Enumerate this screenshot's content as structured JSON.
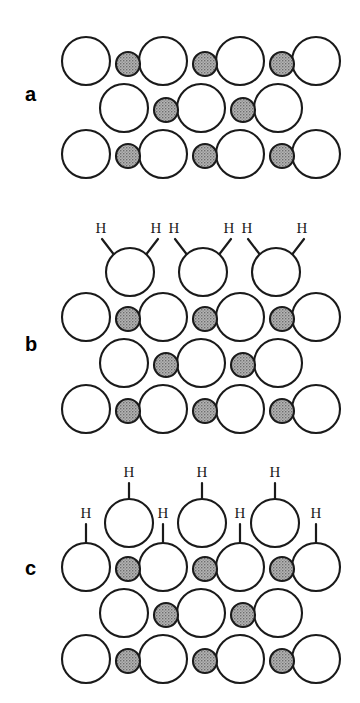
{
  "figure": {
    "background_color": "#ffffff",
    "stroke_color": "#1a1a1a",
    "large_atom_fill": "#ffffff",
    "small_atom_fill": "#9b9b9b",
    "small_atom_texture": "stipple",
    "bond_color": "#1a1a1a",
    "hydrogen_symbol": "H"
  },
  "panels": [
    {
      "id": "a",
      "label": "a",
      "label_x": 25,
      "label_y": 84,
      "description": "clean surface lattice without hydrogen",
      "hydrogen_count": 0,
      "large_atoms": [
        {
          "cx": 86,
          "cy": 61,
          "r": 24
        },
        {
          "cx": 163,
          "cy": 61,
          "r": 24
        },
        {
          "cx": 240,
          "cy": 61,
          "r": 24
        },
        {
          "cx": 316,
          "cy": 61,
          "r": 24
        },
        {
          "cx": 124,
          "cy": 108,
          "r": 24
        },
        {
          "cx": 201,
          "cy": 108,
          "r": 24
        },
        {
          "cx": 278,
          "cy": 108,
          "r": 24
        },
        {
          "cx": 86,
          "cy": 154,
          "r": 24
        },
        {
          "cx": 163,
          "cy": 154,
          "r": 24
        },
        {
          "cx": 240,
          "cy": 154,
          "r": 24
        },
        {
          "cx": 316,
          "cy": 154,
          "r": 24
        }
      ],
      "small_atoms": [
        {
          "cx": 128,
          "cy": 64,
          "r": 12
        },
        {
          "cx": 205,
          "cy": 64,
          "r": 12
        },
        {
          "cx": 282,
          "cy": 64,
          "r": 12
        },
        {
          "cx": 166,
          "cy": 110,
          "r": 12
        },
        {
          "cx": 243,
          "cy": 110,
          "r": 12
        },
        {
          "cx": 128,
          "cy": 156,
          "r": 12
        },
        {
          "cx": 205,
          "cy": 156,
          "r": 12
        },
        {
          "cx": 282,
          "cy": 156,
          "r": 12
        }
      ],
      "hydrogens": [],
      "bonds": []
    },
    {
      "id": "b",
      "label": "b",
      "label_x": 25,
      "label_y": 334,
      "description": "dihydride termination: two hydrogen atoms bonded to each top-layer atom",
      "hydrogen_count": 6,
      "large_atoms": [
        {
          "cx": 130,
          "cy": 272,
          "r": 24
        },
        {
          "cx": 203,
          "cy": 272,
          "r": 24
        },
        {
          "cx": 276,
          "cy": 272,
          "r": 24
        },
        {
          "cx": 86,
          "cy": 317,
          "r": 24
        },
        {
          "cx": 163,
          "cy": 317,
          "r": 24
        },
        {
          "cx": 240,
          "cy": 317,
          "r": 24
        },
        {
          "cx": 316,
          "cy": 317,
          "r": 24
        },
        {
          "cx": 124,
          "cy": 363,
          "r": 24
        },
        {
          "cx": 201,
          "cy": 363,
          "r": 24
        },
        {
          "cx": 278,
          "cy": 363,
          "r": 24
        },
        {
          "cx": 86,
          "cy": 409,
          "r": 24
        },
        {
          "cx": 163,
          "cy": 409,
          "r": 24
        },
        {
          "cx": 240,
          "cy": 409,
          "r": 24
        },
        {
          "cx": 316,
          "cy": 409,
          "r": 24
        }
      ],
      "small_atoms": [
        {
          "cx": 128,
          "cy": 319,
          "r": 12
        },
        {
          "cx": 205,
          "cy": 319,
          "r": 12
        },
        {
          "cx": 282,
          "cy": 319,
          "r": 12
        },
        {
          "cx": 166,
          "cy": 365,
          "r": 12
        },
        {
          "cx": 243,
          "cy": 365,
          "r": 12
        },
        {
          "cx": 128,
          "cy": 411,
          "r": 12
        },
        {
          "cx": 205,
          "cy": 411,
          "r": 12
        },
        {
          "cx": 282,
          "cy": 411,
          "r": 12
        }
      ],
      "hydrogens": [
        {
          "x": 101,
          "y": 233
        },
        {
          "x": 156,
          "y": 233
        },
        {
          "x": 174,
          "y": 233
        },
        {
          "x": 229,
          "y": 233
        },
        {
          "x": 247,
          "y": 233
        },
        {
          "x": 302,
          "y": 233
        }
      ],
      "bonds": [
        {
          "x1": 115,
          "y1": 256,
          "x2": 102,
          "y2": 239
        },
        {
          "x1": 145,
          "y1": 256,
          "x2": 158,
          "y2": 239
        },
        {
          "x1": 188,
          "y1": 256,
          "x2": 175,
          "y2": 239
        },
        {
          "x1": 218,
          "y1": 256,
          "x2": 231,
          "y2": 239
        },
        {
          "x1": 261,
          "y1": 256,
          "x2": 248,
          "y2": 239
        },
        {
          "x1": 291,
          "y1": 256,
          "x2": 304,
          "y2": 239
        }
      ]
    },
    {
      "id": "c",
      "label": "c",
      "label_x": 25,
      "label_y": 558,
      "description": "monohydride termination: one hydrogen atom bonded to each surface atom",
      "hydrogen_count": 7,
      "large_atoms": [
        {
          "cx": 129,
          "cy": 523,
          "r": 24
        },
        {
          "cx": 202,
          "cy": 523,
          "r": 24
        },
        {
          "cx": 275,
          "cy": 523,
          "r": 24
        },
        {
          "cx": 86,
          "cy": 567,
          "r": 24
        },
        {
          "cx": 163,
          "cy": 567,
          "r": 24
        },
        {
          "cx": 240,
          "cy": 567,
          "r": 24
        },
        {
          "cx": 316,
          "cy": 567,
          "r": 24
        },
        {
          "cx": 124,
          "cy": 613,
          "r": 24
        },
        {
          "cx": 201,
          "cy": 613,
          "r": 24
        },
        {
          "cx": 278,
          "cy": 613,
          "r": 24
        },
        {
          "cx": 86,
          "cy": 659,
          "r": 24
        },
        {
          "cx": 163,
          "cy": 659,
          "r": 24
        },
        {
          "cx": 240,
          "cy": 659,
          "r": 24
        },
        {
          "cx": 316,
          "cy": 659,
          "r": 24
        }
      ],
      "small_atoms": [
        {
          "cx": 128,
          "cy": 569,
          "r": 12
        },
        {
          "cx": 205,
          "cy": 569,
          "r": 12
        },
        {
          "cx": 282,
          "cy": 569,
          "r": 12
        },
        {
          "cx": 166,
          "cy": 615,
          "r": 12
        },
        {
          "cx": 243,
          "cy": 615,
          "r": 12
        },
        {
          "cx": 128,
          "cy": 661,
          "r": 12
        },
        {
          "cx": 205,
          "cy": 661,
          "r": 12
        },
        {
          "cx": 282,
          "cy": 661,
          "r": 12
        }
      ],
      "hydrogens": [
        {
          "x": 129,
          "y": 477
        },
        {
          "x": 202,
          "y": 477
        },
        {
          "x": 275,
          "y": 477
        },
        {
          "x": 86,
          "y": 518
        },
        {
          "x": 163,
          "y": 518
        },
        {
          "x": 240,
          "y": 518
        },
        {
          "x": 316,
          "y": 518
        }
      ],
      "bonds": [
        {
          "x1": 129,
          "y1": 499,
          "x2": 129,
          "y2": 483
        },
        {
          "x1": 202,
          "y1": 499,
          "x2": 202,
          "y2": 483
        },
        {
          "x1": 275,
          "y1": 499,
          "x2": 275,
          "y2": 483
        },
        {
          "x1": 86,
          "y1": 543,
          "x2": 86,
          "y2": 524
        },
        {
          "x1": 163,
          "y1": 543,
          "x2": 163,
          "y2": 524
        },
        {
          "x1": 240,
          "y1": 543,
          "x2": 240,
          "y2": 524
        },
        {
          "x1": 316,
          "y1": 543,
          "x2": 316,
          "y2": 524
        }
      ]
    }
  ]
}
